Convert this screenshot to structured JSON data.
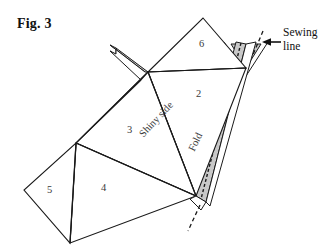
{
  "figure": {
    "title": "Fig. 3",
    "callout": {
      "line1": "Sewing",
      "line2": "line",
      "arrow_icon": "arrow-left-icon"
    },
    "labels": {
      "shiny_side": "Shiny side",
      "fold": "Fold"
    },
    "regions": [
      {
        "id": "region-2",
        "number": "2"
      },
      {
        "id": "region-3",
        "number": "3"
      },
      {
        "id": "region-4",
        "number": "4"
      },
      {
        "id": "region-5",
        "number": "5"
      },
      {
        "id": "region-6",
        "number": "6"
      }
    ],
    "colors": {
      "outline": "#1a1a1a",
      "seam_allowance_fill": "#c8c8c8",
      "paper_fill": "#ffffff",
      "background": "#ffffff",
      "text": "#111111"
    }
  }
}
